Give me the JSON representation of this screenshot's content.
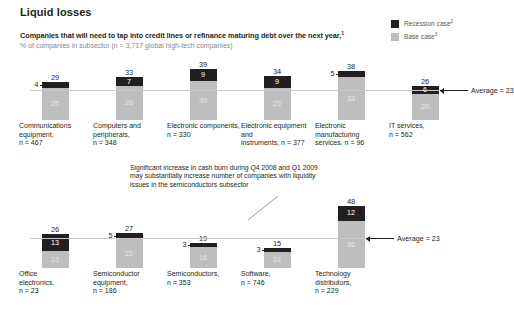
{
  "header": {
    "title": "Liquid losses",
    "subtitle": "Companies that will need to tap into credit lines or refinance maturing debt over the next year,",
    "subtitle_sup": "1",
    "subsubtitle": "% of companies in subsector (n = 3,717 global high-tech companies)"
  },
  "legend": {
    "items": [
      {
        "label": "Recession case",
        "sup": "2",
        "color": "#231f20",
        "name": "recession-case"
      },
      {
        "label": "Base case",
        "sup": "3",
        "color": "#bcbec0",
        "name": "base-case"
      }
    ]
  },
  "annotation": {
    "text": "Significant increase in cash burn during Q4 2008 and Q1 2009 may substantially increase number of companies with liquidity issues in the semiconductors subsector"
  },
  "average": {
    "label_row1": "Average = 23",
    "label_row2": "Average = 23",
    "value": 23
  },
  "chart_data": {
    "type": "bar",
    "title": "Companies that will need to tap into credit lines or refinance maturing debt over the next year",
    "subtitle": "% of companies in subsector (n = 3,717 global high-tech companies)",
    "xlabel": "",
    "ylabel": "% of companies in subsector",
    "ylim": [
      0,
      48
    ],
    "grid": false,
    "legend_position": "top-right",
    "stacked": true,
    "average_line": 23,
    "series": [
      {
        "name": "Recession case",
        "color": "#231f20"
      },
      {
        "name": "Base case",
        "color": "#bcbec0"
      }
    ],
    "rows": [
      {
        "row": 1,
        "average": 23,
        "average_label": "Average = 23",
        "groups": [
          {
            "label": "Communications equipment,",
            "n_label": "n = 467",
            "total": 29,
            "recession": 4,
            "base": 25,
            "recession_label_outside": true
          },
          {
            "label": "Computers and peripherals,",
            "n_label": "n = 348",
            "total": 33,
            "recession": 7,
            "base": 26,
            "recession_label_outside": false
          },
          {
            "label": "Electronic components,",
            "n_label": "n = 330",
            "total": 39,
            "recession": 9,
            "base": 30,
            "recession_label_outside": false
          },
          {
            "label": "Electronic equipment and",
            "n_label": "instruments, n = 377",
            "total": 34,
            "recession": 9,
            "base": 25,
            "recession_label_outside": false
          },
          {
            "label": "Electronic manufacturing",
            "n_label": "services, n = 96",
            "total": 38,
            "recession": 5,
            "base": 33,
            "recession_label_outside": true
          },
          {
            "label": "IT services,",
            "n_label": "n = 562",
            "total": 26,
            "recession": 6,
            "base": 20,
            "recession_label_outside": false
          }
        ]
      },
      {
        "row": 2,
        "average": 23,
        "average_label": "Average = 23",
        "groups": [
          {
            "label": "Office",
            "label2": "electronics,",
            "n_label": "n = 23",
            "total": 26,
            "recession": 13,
            "base": 13,
            "recession_label_outside": false
          },
          {
            "label": "Semiconductor",
            "label2": "equipment,",
            "n_label": "n = 186",
            "total": 27,
            "recession": 5,
            "base": 22,
            "recession_label_outside": true
          },
          {
            "label": "Semiconductors,",
            "label2": "n = 353",
            "n_label": "",
            "total": 19,
            "recession": 3,
            "base": 16,
            "recession_label_outside": true
          },
          {
            "label": "Software,",
            "label2": "n = 746",
            "n_label": "",
            "total": 15,
            "recession": 3,
            "base": 12,
            "recession_label_outside": true
          },
          {
            "label": "Technology",
            "label2": "distributors,",
            "n_label": "n = 229",
            "total": 48,
            "recession": 12,
            "base": 36,
            "recession_label_outside": false
          }
        ]
      }
    ]
  }
}
